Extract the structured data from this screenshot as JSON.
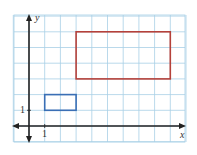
{
  "diagram": {
    "type": "coordinate-grid",
    "grid": {
      "x_min": -1,
      "x_max": 10,
      "y_min": -1,
      "y_max": 7,
      "cell_px": 15.7,
      "origin_px": [
        29,
        126
      ],
      "color": "#a8cfe6"
    },
    "axes": {
      "x_label": "x",
      "y_label": "y",
      "x_tick_label": "1",
      "y_tick_label": "1",
      "color": "#222222"
    },
    "shapes": [
      {
        "name": "small-rectangle",
        "color": "#3a6fb5",
        "x1": 1,
        "y1": 1,
        "x2": 3,
        "y2": 2
      },
      {
        "name": "large-rectangle",
        "color": "#b5413a",
        "x1": 3,
        "y1": 3,
        "x2": 9,
        "y2": 6
      }
    ]
  },
  "chart_data": {
    "type": "diagram",
    "title": "",
    "xlabel": "x",
    "ylabel": "y",
    "x_tick_labels": [
      "1"
    ],
    "y_tick_labels": [
      "1"
    ],
    "grid": true,
    "shapes": [
      {
        "kind": "rectangle",
        "color": "blue",
        "corners": [
          [
            1,
            1
          ],
          [
            3,
            1
          ],
          [
            3,
            2
          ],
          [
            1,
            2
          ]
        ],
        "width": 2,
        "height": 1
      },
      {
        "kind": "rectangle",
        "color": "red",
        "corners": [
          [
            3,
            3
          ],
          [
            9,
            3
          ],
          [
            9,
            6
          ],
          [
            3,
            6
          ]
        ],
        "width": 6,
        "height": 3
      }
    ]
  }
}
